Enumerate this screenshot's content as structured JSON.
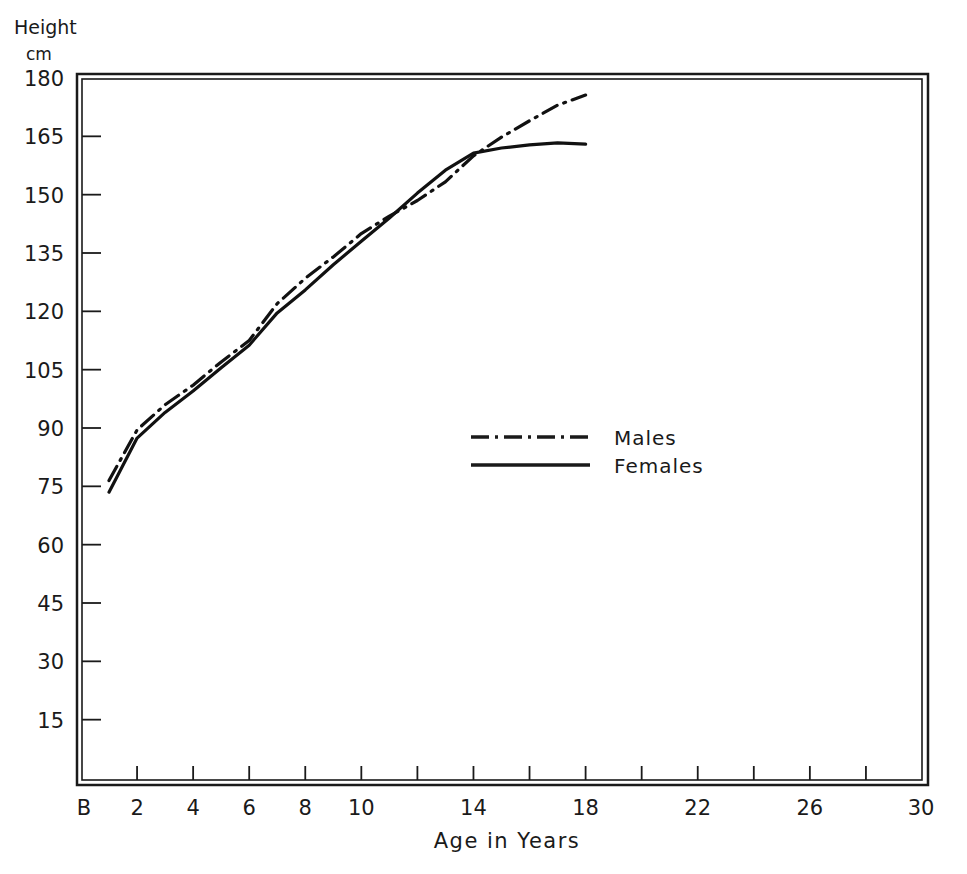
{
  "chart_data": {
    "type": "line",
    "title": "",
    "ylabel": "Height",
    "ylabel_unit": "cm",
    "xlabel": "Age in Years",
    "ylim": [
      0,
      180
    ],
    "xlim": [
      0,
      30
    ],
    "y_ticks": [
      15,
      30,
      45,
      60,
      75,
      90,
      105,
      120,
      135,
      150,
      165,
      180
    ],
    "y_tick_labels": [
      "15",
      "30",
      "45",
      "60",
      "75",
      "90",
      "105",
      "120",
      "135",
      "150",
      "165",
      "180"
    ],
    "x_ticks": [
      2,
      4,
      6,
      8,
      10,
      12,
      14,
      16,
      18,
      20,
      22,
      24,
      26,
      28
    ],
    "x_tick_labels": [
      {
        "value": 0,
        "label": "B"
      },
      {
        "value": 2,
        "label": "2"
      },
      {
        "value": 4,
        "label": "4"
      },
      {
        "value": 6,
        "label": "6"
      },
      {
        "value": 8,
        "label": "8"
      },
      {
        "value": 10,
        "label": "10"
      },
      {
        "value": 14,
        "label": "14"
      },
      {
        "value": 18,
        "label": "18"
      },
      {
        "value": 22,
        "label": "22"
      },
      {
        "value": 26,
        "label": "26"
      },
      {
        "value": 30,
        "label": "30"
      }
    ],
    "grid": false,
    "legend_position": "center-right inside plot",
    "series": [
      {
        "name": "Males",
        "style": "dash-dot",
        "x": [
          1,
          2,
          3,
          4,
          5,
          6,
          7,
          8,
          9,
          10,
          11,
          12,
          13,
          14,
          15,
          16,
          17,
          18
        ],
        "values": [
          76.5,
          89.5,
          96,
          101,
          107,
          112.5,
          122,
          128.5,
          134,
          140,
          144.5,
          148.5,
          153.3,
          160,
          164.8,
          169,
          173,
          175.6
        ]
      },
      {
        "name": "Females",
        "style": "solid",
        "x": [
          1,
          2,
          3,
          4,
          5,
          6,
          7,
          8,
          9,
          10,
          11,
          12,
          13,
          14,
          15,
          16,
          17,
          18
        ],
        "values": [
          73.5,
          87.4,
          94,
          99.5,
          105.5,
          111.3,
          119.6,
          125.5,
          132,
          138,
          144,
          150.4,
          156.3,
          160.7,
          162,
          162.8,
          163.3,
          163
        ]
      }
    ]
  },
  "legend": {
    "males_label": "Males",
    "females_label": "Females"
  },
  "axes": {
    "y_title": "Height",
    "y_unit": "cm",
    "x_title": "Age in Years"
  }
}
